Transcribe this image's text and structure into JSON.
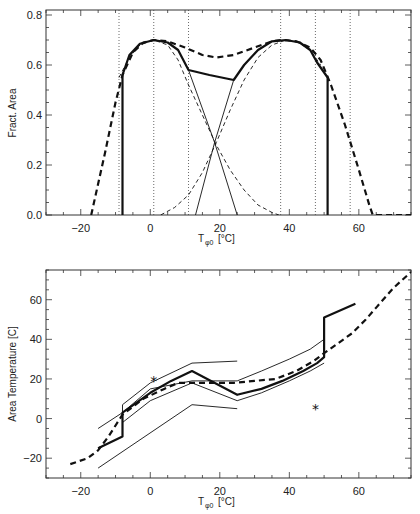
{
  "chart_data": [
    {
      "type": "line",
      "title": "",
      "xlabel": "T_φ0 [°C]",
      "ylabel": "Fract. Area",
      "xlim": [
        -30,
        75
      ],
      "ylim": [
        0,
        0.82
      ],
      "xticks": [
        -20,
        0,
        20,
        40,
        60
      ],
      "xtick_labels": [
        "-20",
        "0",
        "20",
        "40",
        "60"
      ],
      "yticks": [
        0.0,
        0.2,
        0.4,
        0.6,
        0.8
      ],
      "ytick_labels": [
        "0.0",
        "0.2",
        "0.4",
        "0.6",
        "0.8"
      ],
      "grid": false,
      "vertical_reference_lines": [
        -9,
        1,
        11,
        37.5,
        47.5,
        57.5
      ],
      "series": [
        {
          "name": "total (thick solid)",
          "style": "thick-solid",
          "x": [
            -8,
            -8,
            -6,
            -3,
            1,
            5,
            8,
            11,
            17,
            24,
            27,
            31,
            35,
            39,
            43,
            46,
            48,
            50,
            51,
            51
          ],
          "y": [
            0,
            0.56,
            0.64,
            0.685,
            0.7,
            0.69,
            0.66,
            0.58,
            0.56,
            0.54,
            0.6,
            0.66,
            0.695,
            0.7,
            0.69,
            0.66,
            0.61,
            0.57,
            0.55,
            0
          ]
        },
        {
          "name": "envelope (thick dashed)",
          "style": "thick-dashed",
          "x": [
            -17,
            -13,
            -10,
            -8,
            -5,
            -2,
            1,
            5,
            10,
            15,
            19,
            24,
            30,
            35,
            38,
            42,
            46,
            49,
            52,
            56,
            60,
            63,
            64,
            70,
            75
          ],
          "y": [
            0,
            0.25,
            0.45,
            0.56,
            0.65,
            0.69,
            0.7,
            0.695,
            0.67,
            0.64,
            0.63,
            0.64,
            0.67,
            0.695,
            0.7,
            0.695,
            0.67,
            0.62,
            0.52,
            0.36,
            0.18,
            0.04,
            0,
            0,
            0
          ]
        },
        {
          "name": "component 1 (thin dashed)",
          "style": "thin-dashed",
          "x": [
            -9,
            -6,
            -3,
            1,
            5,
            8,
            11,
            15,
            19,
            23,
            27,
            31,
            35,
            37
          ],
          "y": [
            0.55,
            0.63,
            0.68,
            0.7,
            0.68,
            0.62,
            0.52,
            0.4,
            0.28,
            0.18,
            0.1,
            0.04,
            0.01,
            0
          ]
        },
        {
          "name": "component 2 (thin dashed)",
          "style": "thin-dashed",
          "x": [
            3,
            7,
            11,
            15,
            19,
            23,
            27,
            31,
            35,
            39,
            42,
            46,
            49
          ],
          "y": [
            0,
            0.03,
            0.08,
            0.17,
            0.29,
            0.42,
            0.54,
            0.63,
            0.68,
            0.7,
            0.695,
            0.66,
            0.6
          ]
        },
        {
          "name": "linear decreasing (thin solid)",
          "style": "thin-solid",
          "x": [
            11,
            18.5,
            25
          ],
          "y": [
            0.58,
            0.29,
            0
          ]
        },
        {
          "name": "linear increasing (thin solid)",
          "style": "thin-solid",
          "x": [
            13,
            18.5,
            24
          ],
          "y": [
            0,
            0.29,
            0.54
          ]
        }
      ]
    },
    {
      "type": "line",
      "title": "",
      "xlabel": "T_φ0 [°C]",
      "ylabel": "Area Temperature [C]",
      "xlim": [
        -30,
        75
      ],
      "ylim": [
        -30,
        75
      ],
      "xticks": [
        -20,
        0,
        20,
        40,
        60
      ],
      "xtick_labels": [
        "-20",
        "0",
        "20",
        "40",
        "60"
      ],
      "yticks": [
        -20,
        0,
        20,
        40,
        60
      ],
      "ytick_labels": [
        "-20",
        "0",
        "20",
        "40",
        "60"
      ],
      "grid": false,
      "series": [
        {
          "name": "area temperature (thick solid)",
          "style": "thick-solid",
          "x": [
            -15,
            -8,
            -8,
            0,
            6,
            12,
            25,
            32,
            38,
            44,
            48,
            50,
            50,
            59
          ],
          "y": [
            -15,
            -9,
            3,
            13,
            19,
            24,
            12,
            15,
            19,
            24,
            28,
            31,
            51,
            58
          ]
        },
        {
          "name": "reference (thick dashed)",
          "style": "thick-dashed",
          "x": [
            -23,
            -18,
            -15,
            -12,
            -8,
            -2,
            4,
            8,
            12,
            24,
            30,
            36,
            42,
            47,
            50,
            54,
            58,
            62,
            65,
            70,
            75
          ],
          "y": [
            -23,
            -20,
            -16,
            -9,
            2,
            10,
            15,
            18,
            18,
            18,
            19,
            20,
            24,
            29,
            33,
            38,
            43,
            50,
            56,
            66,
            74
          ]
        },
        {
          "name": "upper bound (thin solid)",
          "style": "thin-solid",
          "x": [
            -8,
            -8,
            0,
            12,
            25
          ],
          "y": [
            3,
            7,
            18,
            28,
            29
          ]
        },
        {
          "name": "upper bound 2 (thin solid)",
          "style": "thin-solid",
          "x": [
            -15,
            -8,
            0,
            12,
            25,
            32,
            40,
            46,
            50
          ],
          "y": [
            -5,
            3,
            15,
            19,
            19,
            24,
            30,
            35,
            40
          ]
        },
        {
          "name": "lower bound (thin solid)",
          "style": "thin-solid",
          "x": [
            -8,
            0,
            12,
            25,
            32,
            40,
            46,
            50
          ],
          "y": [
            -2,
            9,
            18,
            9,
            13,
            19,
            24,
            28
          ]
        },
        {
          "name": "lower bound 2 (thin solid)",
          "style": "thin-solid",
          "x": [
            -15,
            12,
            25
          ],
          "y": [
            -25,
            7,
            5
          ]
        }
      ],
      "markers": [
        {
          "symbol": "asterisk",
          "x": 1,
          "y": 19.5
        },
        {
          "symbol": "asterisk",
          "x": 47.5,
          "y": 5.5
        }
      ]
    }
  ],
  "labels": {
    "top_ylabel": "Fract. Area",
    "bottom_ylabel": "Area Temperature [C]",
    "xlabel_main": "T",
    "xlabel_sub": "φ0",
    "xlabel_unit": "[°C]",
    "asterisk": "*"
  }
}
